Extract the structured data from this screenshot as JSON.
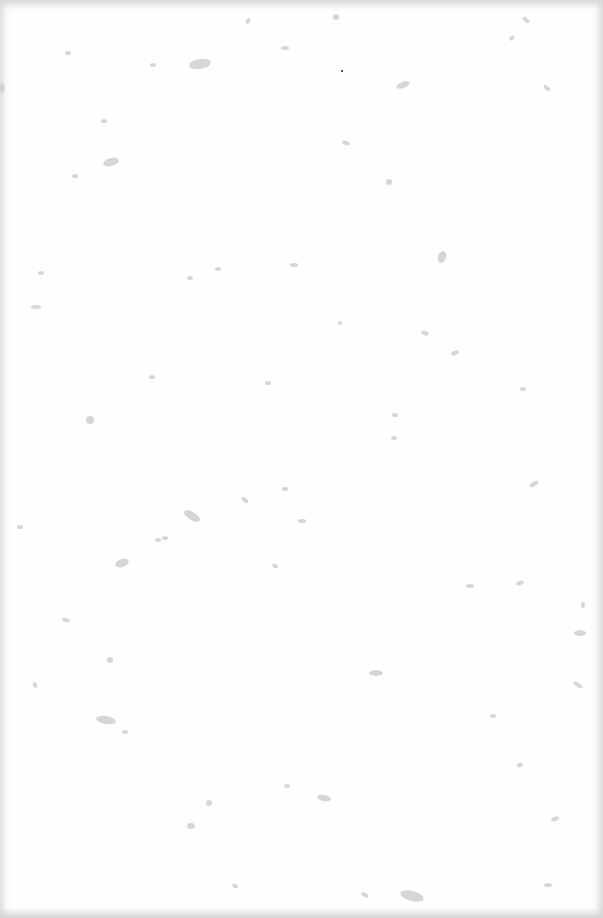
{
  "page": {
    "type": "blank-paper-sheet",
    "background_color": "#fefefe",
    "speck_color": "#c8c8c8",
    "text_content": []
  },
  "specks": [
    {
      "x": 200,
      "y": 64,
      "rx": 11,
      "ry": 5,
      "rot": -10
    },
    {
      "x": 111,
      "y": 162,
      "rx": 8,
      "ry": 4,
      "rot": -15
    },
    {
      "x": 403,
      "y": 85,
      "rx": 7,
      "ry": 3,
      "rot": -20
    },
    {
      "x": 442,
      "y": 257,
      "rx": 4,
      "ry": 6,
      "rot": 20
    },
    {
      "x": 389,
      "y": 182,
      "rx": 3,
      "ry": 3,
      "rot": 0
    },
    {
      "x": 90,
      "y": 420,
      "rx": 4,
      "ry": 4,
      "rot": 0
    },
    {
      "x": 192,
      "y": 516,
      "rx": 9,
      "ry": 4,
      "rot": 30
    },
    {
      "x": 122,
      "y": 563,
      "rx": 7,
      "ry": 4,
      "rot": -20
    },
    {
      "x": 106,
      "y": 720,
      "rx": 10,
      "ry": 4,
      "rot": 10
    },
    {
      "x": 376,
      "y": 673,
      "rx": 7,
      "ry": 3,
      "rot": 0
    },
    {
      "x": 110,
      "y": 660,
      "rx": 3,
      "ry": 3,
      "rot": 0
    },
    {
      "x": 324,
      "y": 798,
      "rx": 7,
      "ry": 3,
      "rot": 10
    },
    {
      "x": 412,
      "y": 896,
      "rx": 12,
      "ry": 5,
      "rot": 15
    },
    {
      "x": 580,
      "y": 633,
      "rx": 6,
      "ry": 3,
      "rot": 0
    },
    {
      "x": 285,
      "y": 489,
      "rx": 3,
      "ry": 2,
      "rot": 0
    },
    {
      "x": 294,
      "y": 265,
      "rx": 4,
      "ry": 2,
      "rot": 0
    },
    {
      "x": 534,
      "y": 484,
      "rx": 5,
      "ry": 2,
      "rot": -30
    },
    {
      "x": 36,
      "y": 307,
      "rx": 5,
      "ry": 2,
      "rot": 0
    },
    {
      "x": 578,
      "y": 685,
      "rx": 5,
      "ry": 2,
      "rot": 30
    },
    {
      "x": 340,
      "y": 323,
      "rx": 2,
      "ry": 2,
      "rot": 0
    },
    {
      "x": 245,
      "y": 500,
      "rx": 4,
      "ry": 2,
      "rot": 40
    },
    {
      "x": 191,
      "y": 826,
      "rx": 4,
      "ry": 3,
      "rot": 0
    },
    {
      "x": 153,
      "y": 65,
      "rx": 3,
      "ry": 2,
      "rot": 0
    },
    {
      "x": 75,
      "y": 176,
      "rx": 3,
      "ry": 2,
      "rot": 0
    },
    {
      "x": 285,
      "y": 48,
      "rx": 4,
      "ry": 2,
      "rot": 0
    },
    {
      "x": 526,
      "y": 20,
      "rx": 4,
      "ry": 2,
      "rot": 40
    },
    {
      "x": 512,
      "y": 38,
      "rx": 3,
      "ry": 2,
      "rot": -40
    },
    {
      "x": 547,
      "y": 88,
      "rx": 4,
      "ry": 2,
      "rot": 40
    },
    {
      "x": 455,
      "y": 353,
      "rx": 4,
      "ry": 2,
      "rot": -20
    },
    {
      "x": 425,
      "y": 333,
      "rx": 4,
      "ry": 2,
      "rot": 20
    },
    {
      "x": 395,
      "y": 415,
      "rx": 3,
      "ry": 2,
      "rot": 0
    },
    {
      "x": 394,
      "y": 438,
      "rx": 3,
      "ry": 2,
      "rot": 0
    },
    {
      "x": 275,
      "y": 566,
      "rx": 3,
      "ry": 2,
      "rot": 30
    },
    {
      "x": 165,
      "y": 538,
      "rx": 3,
      "ry": 2,
      "rot": 0
    },
    {
      "x": 302,
      "y": 521,
      "rx": 4,
      "ry": 2,
      "rot": 0
    },
    {
      "x": 470,
      "y": 586,
      "rx": 4,
      "ry": 2,
      "rot": 0
    },
    {
      "x": 520,
      "y": 583,
      "rx": 4,
      "ry": 2,
      "rot": -20
    },
    {
      "x": 520,
      "y": 765,
      "rx": 3,
      "ry": 2,
      "rot": -20
    },
    {
      "x": 555,
      "y": 819,
      "rx": 4,
      "ry": 2,
      "rot": -20
    },
    {
      "x": 287,
      "y": 786,
      "rx": 3,
      "ry": 2,
      "rot": 0
    },
    {
      "x": 209,
      "y": 803,
      "rx": 3,
      "ry": 3,
      "rot": 0
    },
    {
      "x": 365,
      "y": 895,
      "rx": 4,
      "ry": 2,
      "rot": 30
    },
    {
      "x": 66,
      "y": 620,
      "rx": 4,
      "ry": 2,
      "rot": 10
    },
    {
      "x": 35,
      "y": 685,
      "rx": 3,
      "ry": 2,
      "rot": 60
    },
    {
      "x": 20,
      "y": 527,
      "rx": 3,
      "ry": 2,
      "rot": 0
    },
    {
      "x": 41,
      "y": 273,
      "rx": 3,
      "ry": 2,
      "rot": 0
    },
    {
      "x": 104,
      "y": 121,
      "rx": 3,
      "ry": 2,
      "rot": 0
    },
    {
      "x": 68,
      "y": 53,
      "rx": 3,
      "ry": 2,
      "rot": 0
    },
    {
      "x": 248,
      "y": 21,
      "rx": 2,
      "ry": 3,
      "rot": 30
    },
    {
      "x": 336,
      "y": 17,
      "rx": 3,
      "ry": 3,
      "rot": 0
    },
    {
      "x": 346,
      "y": 143,
      "rx": 4,
      "ry": 2,
      "rot": 20
    },
    {
      "x": 218,
      "y": 269,
      "rx": 3,
      "ry": 2,
      "rot": 0
    },
    {
      "x": 190,
      "y": 278,
      "rx": 3,
      "ry": 2,
      "rot": 0
    },
    {
      "x": 268,
      "y": 383,
      "rx": 3,
      "ry": 2,
      "rot": 0
    },
    {
      "x": 152,
      "y": 377,
      "rx": 3,
      "ry": 2,
      "rot": 0
    },
    {
      "x": 158,
      "y": 540,
      "rx": 3,
      "ry": 2,
      "rot": 0
    },
    {
      "x": 125,
      "y": 732,
      "rx": 3,
      "ry": 2,
      "rot": 0
    },
    {
      "x": 235,
      "y": 886,
      "rx": 3,
      "ry": 2,
      "rot": 30
    },
    {
      "x": 548,
      "y": 885,
      "rx": 4,
      "ry": 2,
      "rot": 0
    },
    {
      "x": 493,
      "y": 716,
      "rx": 3,
      "ry": 2,
      "rot": 0
    },
    {
      "x": 523,
      "y": 389,
      "rx": 3,
      "ry": 2,
      "rot": 0
    },
    {
      "x": 583,
      "y": 605,
      "rx": 2,
      "ry": 3,
      "rot": 0
    },
    {
      "x": 2,
      "y": 88,
      "rx": 3,
      "ry": 5,
      "rot": 0
    }
  ],
  "dark_dot": {
    "x": 342,
    "y": 71
  }
}
